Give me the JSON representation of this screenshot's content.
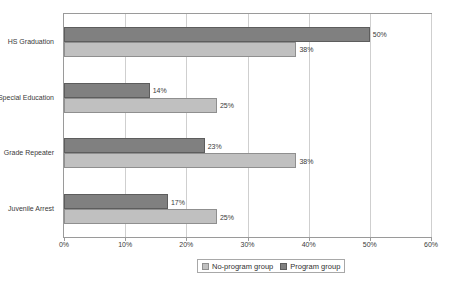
{
  "chart_data": {
    "type": "bar",
    "orientation": "horizontal",
    "title": "",
    "xlabel": "",
    "ylabel": "",
    "xlim": [
      0,
      60
    ],
    "xticks": [
      "0%",
      "10%",
      "20%",
      "30%",
      "40%",
      "50%",
      "60%"
    ],
    "xtick_values": [
      0,
      10,
      20,
      30,
      40,
      50,
      60
    ],
    "grid": true,
    "legend_position": "bottom",
    "categories": [
      "HS Graduation",
      "Special Education",
      "Grade Repeater",
      "Juvenile Arrest"
    ],
    "series": [
      {
        "name": "No-program group",
        "color": "#c0c0c0",
        "values": [
          38,
          25,
          38,
          25
        ],
        "labels": [
          "38%",
          "25%",
          "38%",
          "25%"
        ]
      },
      {
        "name": "Program group",
        "color": "#808080",
        "values": [
          50,
          14,
          23,
          17
        ],
        "labels": [
          "50%",
          "14%",
          "23%",
          "17%"
        ]
      }
    ]
  },
  "legend": {
    "entries": [
      {
        "label": "No-program group",
        "swatch": "light"
      },
      {
        "label": "Program group",
        "swatch": "dark"
      }
    ]
  },
  "colors": {
    "no_program_group": "#c0c0c0",
    "program_group": "#808080",
    "axis": "#9a9a9a",
    "gridline": "#cfcfcf",
    "text": "#3a3a3a",
    "background": "#ffffff"
  }
}
